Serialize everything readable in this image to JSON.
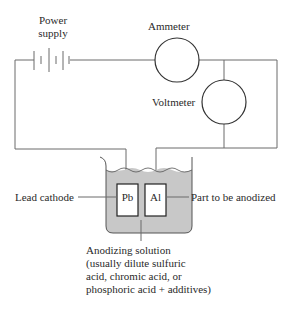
{
  "diagram": {
    "labels": {
      "power_supply_line1": "Power",
      "power_supply_line2": "supply",
      "ammeter": "Ammeter",
      "voltmeter": "Voltmeter",
      "lead_cathode": "Lead cathode",
      "part_anodized": "Part to be anodized",
      "cathode_symbol": "Pb",
      "anode_symbol": "Al",
      "solution_lines": [
        "Anodizing solution",
        "(usually dilute sulfuric",
        "acid, chromic acid, or",
        "phosphoric acid + additives)"
      ]
    },
    "colors": {
      "line": "#6a6a6a",
      "solution_fill": "#c8c8c8",
      "electrode_fill": "#ffffff",
      "text": "#2a2a2a"
    }
  }
}
